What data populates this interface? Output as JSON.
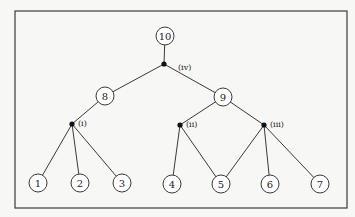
{
  "diagram": {
    "type": "tree",
    "frame": {
      "x": 15,
      "y": 11,
      "width": 332,
      "height": 197
    },
    "node_radius": 9,
    "nodes": [
      {
        "id": "10",
        "label": "10",
        "x": 165,
        "y": 36
      },
      {
        "id": "8",
        "label": "8",
        "x": 105,
        "y": 96
      },
      {
        "id": "9",
        "label": "9",
        "x": 223,
        "y": 97
      },
      {
        "id": "1",
        "label": "1",
        "x": 38,
        "y": 183
      },
      {
        "id": "2",
        "label": "2",
        "x": 80,
        "y": 183
      },
      {
        "id": "3",
        "label": "3",
        "x": 122,
        "y": 183
      },
      {
        "id": "4",
        "label": "4",
        "x": 172,
        "y": 184
      },
      {
        "id": "5",
        "label": "5",
        "x": 221,
        "y": 184
      },
      {
        "id": "6",
        "label": "6",
        "x": 270,
        "y": 184
      },
      {
        "id": "7",
        "label": "7",
        "x": 320,
        "y": 184
      }
    ],
    "junctions": [
      {
        "id": "iv",
        "label": "(iv)",
        "x": 164,
        "y": 64,
        "label_x": 178,
        "label_y": 67
      },
      {
        "id": "i",
        "label": "(i)",
        "x": 72,
        "y": 124,
        "label_x": 78,
        "label_y": 123
      },
      {
        "id": "ii",
        "label": "(ii)",
        "x": 180,
        "y": 125,
        "label_x": 186,
        "label_y": 124
      },
      {
        "id": "iii",
        "label": "(iii)",
        "x": 264,
        "y": 125,
        "label_x": 270,
        "label_y": 124
      }
    ],
    "edges": [
      {
        "from": "10",
        "to": "iv"
      },
      {
        "from": "iv",
        "to": "8"
      },
      {
        "from": "iv",
        "to": "9"
      },
      {
        "from": "8",
        "to": "i"
      },
      {
        "from": "i",
        "to": "1"
      },
      {
        "from": "i",
        "to": "2"
      },
      {
        "from": "i",
        "to": "3"
      },
      {
        "from": "9",
        "to": "ii"
      },
      {
        "from": "9",
        "to": "iii"
      },
      {
        "from": "ii",
        "to": "4"
      },
      {
        "from": "ii",
        "to": "5"
      },
      {
        "from": "iii",
        "to": "5"
      },
      {
        "from": "iii",
        "to": "6"
      },
      {
        "from": "iii",
        "to": "7"
      }
    ]
  }
}
